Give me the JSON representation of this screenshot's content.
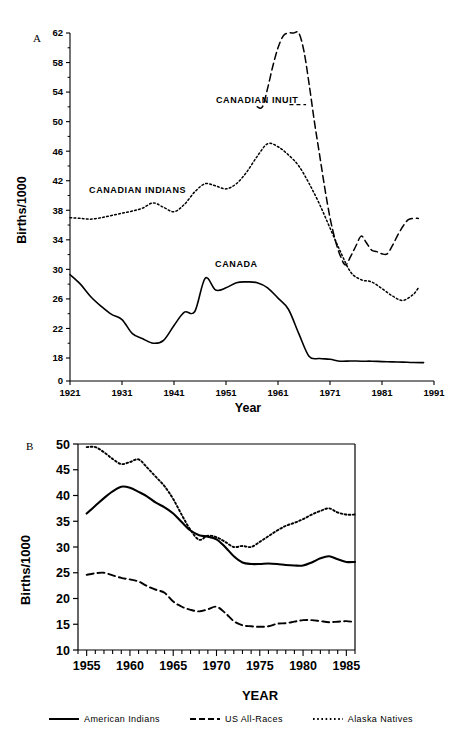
{
  "figure": {
    "panels": [
      {
        "id": "A",
        "label": "A",
        "ylabel": "Births/1000",
        "xlabel": "Year"
      },
      {
        "id": "B",
        "label": "B",
        "ylabel": "Births/1000",
        "xlabel": "YEAR"
      }
    ],
    "legend": {
      "items": [
        {
          "label": "American Indians",
          "style": "solid",
          "swatch": "solid-line-swatch"
        },
        {
          "label": "US All-Races",
          "style": "dashed",
          "swatch": "dashed-line-swatch"
        },
        {
          "label": "Alaska Natives",
          "style": "dotted",
          "swatch": "dotted-line-swatch"
        }
      ]
    }
  },
  "chart_data": [
    {
      "type": "line",
      "panel": "A",
      "title": "",
      "xlabel": "Year",
      "ylabel": "Births/1000",
      "xlim": [
        1921,
        1991
      ],
      "ylim": [
        0,
        62
      ],
      "y_broken_axis": true,
      "y_break_between": [
        0,
        18
      ],
      "xticks": [
        1921,
        1931,
        1941,
        1951,
        1961,
        1971,
        1981,
        1991
      ],
      "yticks": [
        0,
        18,
        22,
        26,
        30,
        34,
        38,
        42,
        46,
        50,
        54,
        58,
        62
      ],
      "grid": false,
      "legend_position": "inline-annotations",
      "annotations": [
        {
          "text": "CANADIAN INUIT",
          "x": 1957,
          "y": 52.5
        },
        {
          "text": "CANADIAN INDIANS",
          "x": 1934,
          "y": 40.3
        },
        {
          "text": "CANADA",
          "x": 1953,
          "y": 30.3
        }
      ],
      "series": [
        {
          "name": "CANADIAN INUIT",
          "style": "dashed",
          "x": [
            1957,
            1958,
            1959,
            1960,
            1961,
            1962,
            1963,
            1964,
            1965,
            1966,
            1967,
            1968,
            1969,
            1970,
            1971,
            1972,
            1973,
            1974,
            1975,
            1976,
            1977,
            1978,
            1979,
            1980,
            1981,
            1982,
            1983,
            1984,
            1985,
            1986,
            1987,
            1988
          ],
          "y": [
            52.0,
            52.0,
            54.5,
            57.5,
            60.0,
            61.6,
            62.0,
            62.0,
            62.0,
            59.5,
            55.0,
            50.0,
            45.5,
            41.0,
            37.0,
            34.0,
            31.8,
            30.6,
            31.8,
            33.2,
            34.5,
            33.6,
            32.6,
            32.4,
            32.1,
            32.1,
            33.2,
            34.6,
            35.8,
            36.7,
            36.9,
            36.9
          ]
        },
        {
          "name": "CANADIAN INDIANS",
          "style": "dotted",
          "x": [
            1921,
            1923,
            1925,
            1927,
            1929,
            1931,
            1933,
            1935,
            1937,
            1939,
            1941,
            1943,
            1945,
            1947,
            1949,
            1951,
            1953,
            1955,
            1957,
            1959,
            1961,
            1963,
            1965,
            1967,
            1969,
            1971,
            1973,
            1975,
            1977,
            1979,
            1981,
            1983,
            1985,
            1987,
            1988
          ],
          "y": [
            37.0,
            36.9,
            36.8,
            37.0,
            37.3,
            37.6,
            37.9,
            38.3,
            39.0,
            38.4,
            37.8,
            38.8,
            40.5,
            41.6,
            41.3,
            40.9,
            41.6,
            43.2,
            45.3,
            47.0,
            46.6,
            45.5,
            44.0,
            41.6,
            38.8,
            35.6,
            32.4,
            29.6,
            28.6,
            28.3,
            27.4,
            26.4,
            25.8,
            26.6,
            27.5
          ]
        },
        {
          "name": "CANADA",
          "style": "solid",
          "x": [
            1921,
            1923,
            1925,
            1927,
            1929,
            1931,
            1933,
            1935,
            1937,
            1939,
            1941,
            1943,
            1945,
            1947,
            1949,
            1951,
            1953,
            1955,
            1957,
            1959,
            1961,
            1963,
            1965,
            1967,
            1969,
            1971,
            1973,
            1975,
            1977,
            1979,
            1981,
            1983,
            1985,
            1987,
            1989
          ],
          "y": [
            29.3,
            28.0,
            26.3,
            25.0,
            23.9,
            23.2,
            21.3,
            20.6,
            20.0,
            20.4,
            22.4,
            24.2,
            24.3,
            28.8,
            27.2,
            27.5,
            28.2,
            28.3,
            28.2,
            27.5,
            26.1,
            24.6,
            21.3,
            18.2,
            17.6,
            17.0,
            15.5,
            15.7,
            15.5,
            15.5,
            15.2,
            15.0,
            14.8,
            14.5,
            14.4
          ]
        }
      ]
    },
    {
      "type": "line",
      "panel": "B",
      "title": "",
      "xlabel": "YEAR",
      "ylabel": "Births/1000",
      "xlim": [
        1954,
        1986
      ],
      "ylim": [
        10,
        50
      ],
      "xticks": [
        1955,
        1960,
        1965,
        1970,
        1975,
        1980,
        1985
      ],
      "yticks": [
        10,
        15,
        20,
        25,
        30,
        35,
        40,
        45,
        50
      ],
      "grid": false,
      "legend_position": "bottom",
      "series": [
        {
          "name": "American Indians",
          "style": "solid",
          "x": [
            1955,
            1956,
            1957,
            1958,
            1959,
            1960,
            1961,
            1962,
            1963,
            1964,
            1965,
            1966,
            1967,
            1968,
            1969,
            1970,
            1971,
            1972,
            1973,
            1974,
            1975,
            1976,
            1977,
            1978,
            1979,
            1980,
            1981,
            1982,
            1983,
            1984,
            1985,
            1986
          ],
          "y": [
            36.5,
            38.0,
            39.5,
            40.8,
            41.7,
            41.5,
            40.7,
            39.8,
            38.6,
            37.7,
            36.5,
            34.8,
            33.2,
            32.3,
            32.0,
            31.5,
            30.0,
            28.2,
            27.0,
            26.7,
            26.7,
            26.8,
            26.7,
            26.5,
            26.4,
            26.4,
            27.0,
            27.8,
            28.2,
            27.6,
            27.1,
            27.1
          ]
        },
        {
          "name": "US All-Races",
          "style": "dashed",
          "x": [
            1955,
            1956,
            1957,
            1958,
            1959,
            1960,
            1961,
            1962,
            1963,
            1964,
            1965,
            1966,
            1967,
            1968,
            1969,
            1970,
            1971,
            1972,
            1973,
            1974,
            1975,
            1976,
            1977,
            1978,
            1979,
            1980,
            1981,
            1982,
            1983,
            1984,
            1985,
            1986
          ],
          "y": [
            24.6,
            24.9,
            25.0,
            24.5,
            24.0,
            23.7,
            23.3,
            22.4,
            21.7,
            21.1,
            19.4,
            18.4,
            17.8,
            17.5,
            17.9,
            18.4,
            17.2,
            15.6,
            14.8,
            14.6,
            14.5,
            14.6,
            15.1,
            15.2,
            15.5,
            15.8,
            15.8,
            15.6,
            15.4,
            15.5,
            15.6,
            15.4
          ]
        },
        {
          "name": "Alaska Natives",
          "style": "dotted",
          "x": [
            1955,
            1956,
            1957,
            1958,
            1959,
            1960,
            1961,
            1962,
            1963,
            1964,
            1965,
            1966,
            1967,
            1968,
            1969,
            1970,
            1971,
            1972,
            1973,
            1974,
            1975,
            1976,
            1977,
            1978,
            1979,
            1980,
            1981,
            1982,
            1983,
            1984,
            1985,
            1986
          ],
          "y": [
            49.4,
            49.4,
            48.4,
            47.1,
            46.1,
            46.5,
            47.0,
            45.4,
            43.6,
            41.8,
            39.3,
            36.2,
            33.3,
            31.4,
            32.2,
            31.9,
            31.0,
            30.0,
            30.2,
            30.0,
            31.0,
            32.1,
            33.2,
            34.1,
            34.7,
            35.4,
            36.3,
            37.0,
            37.5,
            36.7,
            36.3,
            36.3
          ]
        }
      ]
    }
  ]
}
